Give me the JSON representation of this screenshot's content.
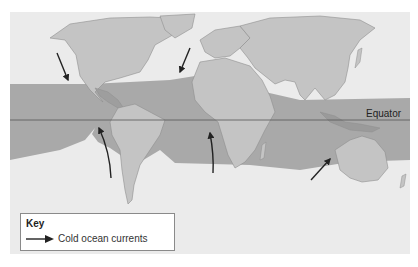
{
  "map": {
    "title": "World map of cold ocean currents",
    "equator_label": "Equator",
    "colors": {
      "background": "#ffffff",
      "ocean": "#ebebeb",
      "land": "#c4c4c4",
      "land_outline": "#8e8e8e",
      "tropical_band": "#a9a9a9",
      "band_land": "#999999",
      "equator_line": "#555555",
      "arrow": "#222222"
    },
    "arrows": [
      {
        "name": "california-current",
        "direction": "south-east"
      },
      {
        "name": "canary-current",
        "direction": "south-west"
      },
      {
        "name": "humboldt-current",
        "direction": "north"
      },
      {
        "name": "benguela-current",
        "direction": "north"
      },
      {
        "name": "west-australian-current",
        "direction": "north-east"
      }
    ]
  },
  "key": {
    "title": "Key",
    "items": [
      {
        "symbol": "arrow",
        "label": "Cold ocean currents"
      }
    ]
  }
}
